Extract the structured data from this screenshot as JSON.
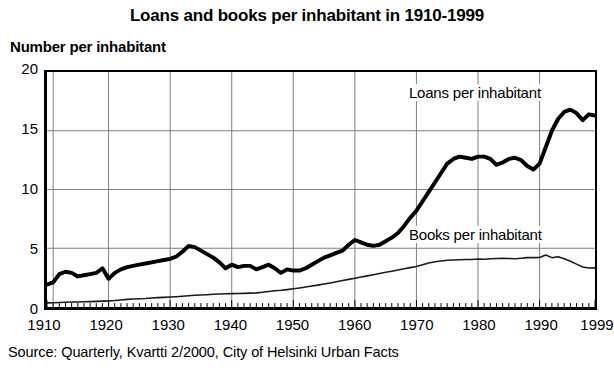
{
  "chart_data": {
    "type": "line",
    "title": "Loans and books per inhabitant in 1910-1999",
    "ylabel": "Number per inhabitant",
    "xlabel": "",
    "source": "Source: Quarterly, Kvartti 2/2000, City of Helsinki Urban Facts",
    "xlim": [
      1910,
      1999
    ],
    "ylim": [
      0,
      20
    ],
    "yticks": [
      0,
      5,
      10,
      15,
      20
    ],
    "ytick_labels": [
      "0",
      "5",
      "10",
      "15",
      "20"
    ],
    "xticks": [
      1910,
      1920,
      1930,
      1940,
      1950,
      1960,
      1970,
      1980,
      1990,
      1999
    ],
    "xtick_labels": [
      "1910",
      "1920",
      "1930",
      "1940",
      "1950",
      "1960",
      "1970",
      "1980",
      "1990",
      "1999"
    ],
    "grid": "both-decades",
    "minor_ticks": "yearly",
    "legend": "inline-annotations",
    "series": [
      {
        "name": "Loans per inhabitant",
        "color": "#000000",
        "width": 4,
        "x": [
          1910,
          1911,
          1912,
          1913,
          1914,
          1915,
          1916,
          1917,
          1918,
          1919,
          1920,
          1921,
          1922,
          1923,
          1924,
          1925,
          1926,
          1927,
          1928,
          1929,
          1930,
          1931,
          1932,
          1933,
          1934,
          1935,
          1936,
          1937,
          1938,
          1939,
          1940,
          1941,
          1942,
          1943,
          1944,
          1945,
          1946,
          1947,
          1948,
          1949,
          1950,
          1951,
          1952,
          1953,
          1954,
          1955,
          1956,
          1957,
          1958,
          1959,
          1960,
          1961,
          1962,
          1963,
          1964,
          1965,
          1966,
          1967,
          1968,
          1969,
          1970,
          1971,
          1972,
          1973,
          1974,
          1975,
          1976,
          1977,
          1978,
          1979,
          1980,
          1981,
          1982,
          1983,
          1984,
          1985,
          1986,
          1987,
          1988,
          1989,
          1990,
          1991,
          1992,
          1993,
          1994,
          1995,
          1996,
          1997,
          1998,
          1999
        ],
        "values": [
          1.9,
          2.1,
          2.8,
          3.0,
          2.9,
          2.6,
          2.7,
          2.8,
          2.9,
          3.3,
          2.4,
          2.9,
          3.2,
          3.4,
          3.5,
          3.6,
          3.7,
          3.8,
          3.9,
          4.0,
          4.1,
          4.3,
          4.7,
          5.2,
          5.1,
          4.8,
          4.5,
          4.2,
          3.8,
          3.3,
          3.6,
          3.4,
          3.5,
          3.5,
          3.2,
          3.4,
          3.6,
          3.3,
          2.9,
          3.2,
          3.1,
          3.1,
          3.3,
          3.6,
          3.9,
          4.2,
          4.4,
          4.6,
          4.8,
          5.3,
          5.7,
          5.5,
          5.3,
          5.2,
          5.3,
          5.6,
          5.9,
          6.3,
          6.9,
          7.6,
          8.2,
          9.0,
          9.8,
          10.6,
          11.4,
          12.2,
          12.6,
          12.8,
          12.7,
          12.6,
          12.8,
          12.8,
          12.6,
          12.1,
          12.3,
          12.6,
          12.7,
          12.5,
          12.0,
          11.7,
          12.2,
          13.6,
          15.0,
          16.0,
          16.6,
          16.8,
          16.5,
          15.9,
          16.4,
          16.3
        ]
      },
      {
        "name": "Books per inhabitant",
        "color": "#1a1a1a",
        "width": 1.6,
        "x": [
          1910,
          1911,
          1912,
          1913,
          1914,
          1915,
          1916,
          1917,
          1918,
          1919,
          1920,
          1921,
          1922,
          1923,
          1924,
          1925,
          1926,
          1927,
          1928,
          1929,
          1930,
          1931,
          1932,
          1933,
          1934,
          1935,
          1936,
          1937,
          1938,
          1939,
          1940,
          1941,
          1942,
          1943,
          1944,
          1945,
          1946,
          1947,
          1948,
          1949,
          1950,
          1951,
          1952,
          1953,
          1954,
          1955,
          1956,
          1957,
          1958,
          1959,
          1960,
          1961,
          1962,
          1963,
          1964,
          1965,
          1966,
          1967,
          1968,
          1969,
          1970,
          1971,
          1972,
          1973,
          1974,
          1975,
          1976,
          1977,
          1978,
          1979,
          1980,
          1981,
          1982,
          1983,
          1984,
          1985,
          1986,
          1987,
          1988,
          1989,
          1990,
          1991,
          1992,
          1993,
          1994,
          1995,
          1996,
          1997,
          1998,
          1999
        ],
        "values": [
          0.35,
          0.36,
          0.38,
          0.4,
          0.42,
          0.43,
          0.45,
          0.46,
          0.48,
          0.5,
          0.52,
          0.55,
          0.6,
          0.65,
          0.68,
          0.7,
          0.72,
          0.76,
          0.8,
          0.82,
          0.85,
          0.88,
          0.92,
          0.96,
          1.0,
          1.02,
          1.05,
          1.08,
          1.1,
          1.12,
          1.14,
          1.15,
          1.16,
          1.18,
          1.2,
          1.25,
          1.32,
          1.38,
          1.42,
          1.48,
          1.55,
          1.62,
          1.7,
          1.78,
          1.86,
          1.95,
          2.05,
          2.15,
          2.25,
          2.35,
          2.45,
          2.55,
          2.65,
          2.75,
          2.85,
          2.95,
          3.05,
          3.15,
          3.25,
          3.35,
          3.45,
          3.6,
          3.75,
          3.85,
          3.92,
          3.98,
          4.0,
          4.02,
          4.05,
          4.05,
          4.08,
          4.06,
          4.1,
          4.12,
          4.15,
          4.12,
          4.1,
          4.15,
          4.2,
          4.2,
          4.22,
          4.42,
          4.2,
          4.28,
          4.1,
          3.9,
          3.65,
          3.4,
          3.32,
          3.33
        ]
      }
    ],
    "annotations": [
      {
        "text": "Loans per inhabitant",
        "x": 1980,
        "y": 18
      },
      {
        "text": "Books per inhabitant",
        "x": 1980,
        "y": 6.2
      }
    ]
  }
}
